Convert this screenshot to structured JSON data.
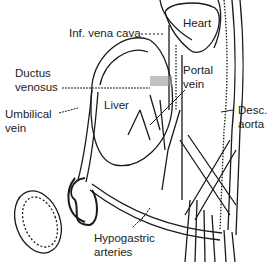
{
  "figure": {
    "labels": {
      "heart": "Heart",
      "ivc": "Inf. vena cava",
      "ductus_1": "Ductus",
      "ductus_2": "venosus",
      "portal_1": "Portal",
      "portal_2": "vein",
      "liver": "Liver",
      "umbilical_1": "Umbilical",
      "umbilical_2": "vein",
      "aorta_1": "Desc.",
      "aorta_2": "aorta",
      "hypo_1": "Hypogastric",
      "hypo_2": "arteries"
    },
    "colors": {
      "line": "#1a1a1a",
      "background": "#ffffff",
      "shade": "#888888"
    }
  }
}
